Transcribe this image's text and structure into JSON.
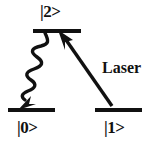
{
  "figure": {
    "type": "energy-level-diagram",
    "background_color": "#ffffff",
    "ink_color": "#111111",
    "width": 149,
    "height": 143
  },
  "levels": [
    {
      "id": "excited",
      "label": "|2>",
      "label_position": "above",
      "line": {
        "x1": 33,
        "x2": 81,
        "y": 31
      }
    },
    {
      "id": "ground",
      "label": "|0>",
      "label_position": "below",
      "line": {
        "x1": 8,
        "x2": 55,
        "y": 110
      }
    },
    {
      "id": "metastable",
      "label": "|1>",
      "label_position": "below",
      "line": {
        "x1": 95,
        "x2": 142,
        "y": 110
      }
    }
  ],
  "transitions": [
    {
      "id": "laser-excitation",
      "label": "Laser",
      "style": "straight-arrow",
      "from_level": "metastable",
      "to_level": "excited",
      "from": {
        "x": 112,
        "y": 106
      },
      "to": {
        "x": 61,
        "y": 33
      }
    },
    {
      "id": "spontaneous-emission",
      "label": "",
      "style": "wavy-arrow",
      "from_level": "excited",
      "to_level": "ground",
      "from": {
        "x": 44,
        "y": 33
      },
      "to": {
        "x": 22,
        "y": 107
      }
    }
  ],
  "annotations": {
    "laser_label": "Laser"
  }
}
